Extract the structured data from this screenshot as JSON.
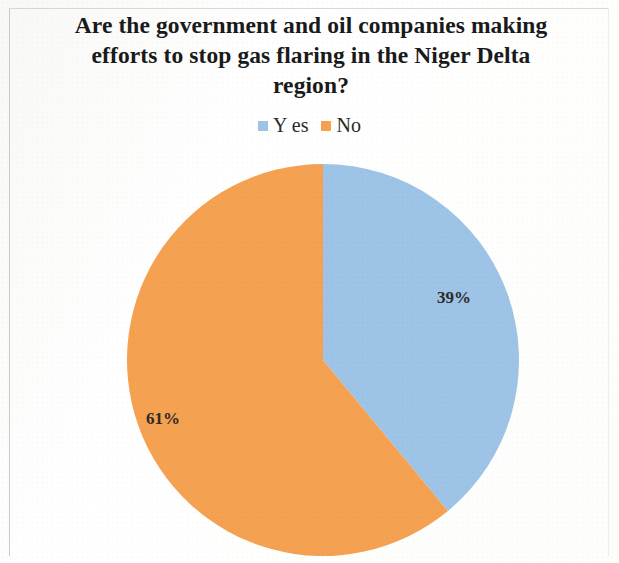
{
  "chart_data": {
    "type": "pie",
    "title": "Are the government and  oil companies making efforts to stop gas flaring in the Niger Delta region?",
    "title_lines": "Are the government and  oil companies making\nefforts to stop gas flaring in the Niger Delta\nregion?",
    "categories": [
      "Yes",
      "No"
    ],
    "values": [
      39,
      61
    ],
    "value_labels": [
      "39%",
      "61%"
    ],
    "colors": [
      "#9dc3e6",
      "#f4a152"
    ],
    "legend_position": "top",
    "grid": false,
    "xlabel": "",
    "ylabel": "",
    "start_angle_deg": 0,
    "direction": "clockwise"
  },
  "legend": {
    "items": [
      {
        "label": "Y es",
        "color": "#9dc3e6",
        "swatch_name": "legend-swatch-yes"
      },
      {
        "label": "No",
        "color": "#f4a152",
        "swatch_name": "legend-swatch-no"
      }
    ]
  },
  "labels": {
    "yes_pct": "39%",
    "no_pct": "61%"
  },
  "figure": {
    "background": "#fefefe",
    "border_color": "#c9c9c9"
  }
}
